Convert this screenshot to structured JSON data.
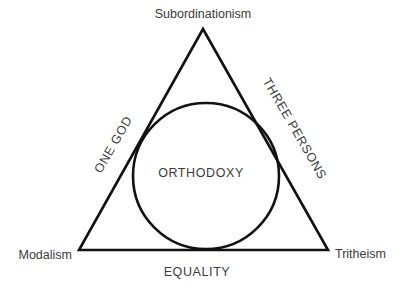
{
  "diagram": {
    "background_color": "#ffffff",
    "stroke_color": "#111111",
    "text_color": "#3b3b3b",
    "shapes": {
      "triangle": {
        "name": "triangle",
        "apex": {
          "x": 203,
          "y": 29
        },
        "bottom_left": {
          "x": 79,
          "y": 250
        },
        "bottom_right": {
          "x": 328,
          "y": 250
        },
        "stroke_width": 2.6
      },
      "circle": {
        "name": "inscribed-circle",
        "cx": 206,
        "cy": 176,
        "r": 73,
        "stroke_width": 2.6
      }
    },
    "vertex_labels": {
      "top": "Subordinationism",
      "bottom_left": "Modalism",
      "bottom_right": "Tritheism"
    },
    "edge_labels": {
      "left": "ONE GOD",
      "right": "THREE PERSONS",
      "bottom": "EQUALITY"
    },
    "center_label": "ORTHODOXY"
  }
}
